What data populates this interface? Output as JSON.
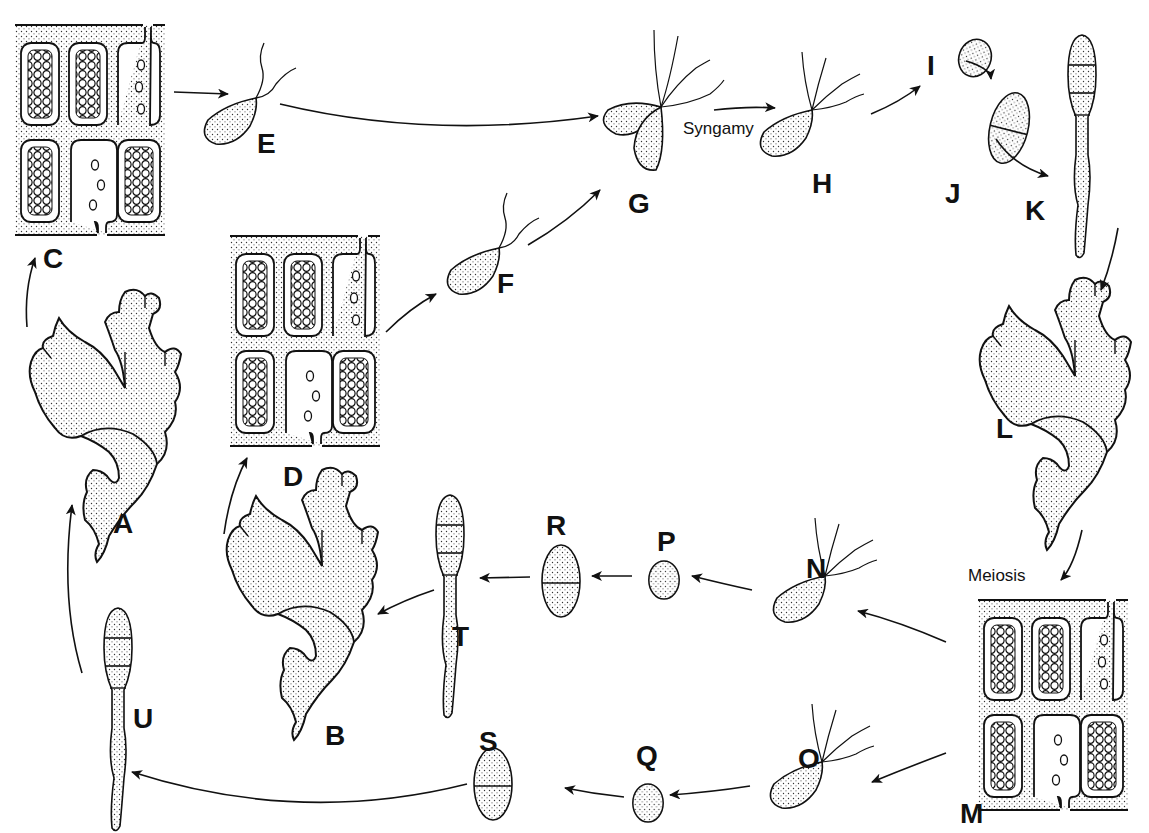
{
  "diagram": {
    "colors": {
      "ink": "#111111",
      "stipple": "#d9d9d9",
      "paper": "#ffffff"
    },
    "annotations": {
      "syngamy": "Syngamy",
      "meiosis": "Meiosis"
    },
    "stages": [
      {
        "id": "A",
        "label": "A",
        "kind": "thallus",
        "x": 113,
        "y": 510
      },
      {
        "id": "B",
        "label": "B",
        "kind": "thallus",
        "x": 325,
        "y": 722
      },
      {
        "id": "C",
        "label": "C",
        "kind": "gametangia-tissue",
        "x": 43,
        "y": 245
      },
      {
        "id": "D",
        "label": "D",
        "kind": "gametangia-tissue",
        "x": 283,
        "y": 463
      },
      {
        "id": "E",
        "label": "E",
        "kind": "biflagellate-gamete",
        "x": 257,
        "y": 130
      },
      {
        "id": "F",
        "label": "F",
        "kind": "biflagellate-gamete",
        "x": 497,
        "y": 270
      },
      {
        "id": "G",
        "label": "G",
        "kind": "fusing-gametes",
        "x": 628,
        "y": 190
      },
      {
        "id": "H",
        "label": "H",
        "kind": "quadriflagellate-zygote",
        "x": 812,
        "y": 170
      },
      {
        "id": "I",
        "label": "I",
        "kind": "zygote",
        "x": 927,
        "y": 52
      },
      {
        "id": "J",
        "label": "J",
        "kind": "two-celled-sporophyte",
        "x": 945,
        "y": 180
      },
      {
        "id": "K",
        "label": "K",
        "kind": "young-sporophyte",
        "x": 1025,
        "y": 197
      },
      {
        "id": "L",
        "label": "L",
        "kind": "thallus",
        "x": 996,
        "y": 415
      },
      {
        "id": "M",
        "label": "M",
        "kind": "sporangia-tissue",
        "x": 960,
        "y": 800
      },
      {
        "id": "N",
        "label": "N",
        "kind": "quadriflagellate-zoospore",
        "x": 806,
        "y": 555
      },
      {
        "id": "O",
        "label": "O",
        "kind": "quadriflagellate-zoospore",
        "x": 798,
        "y": 745
      },
      {
        "id": "P",
        "label": "P",
        "kind": "spore",
        "x": 657,
        "y": 528
      },
      {
        "id": "Q",
        "label": "Q",
        "kind": "spore",
        "x": 636,
        "y": 742
      },
      {
        "id": "R",
        "label": "R",
        "kind": "two-celled-germling",
        "x": 546,
        "y": 512
      },
      {
        "id": "S",
        "label": "S",
        "kind": "two-celled-germling",
        "x": 479,
        "y": 728
      },
      {
        "id": "T",
        "label": "T",
        "kind": "young-gametophyte",
        "x": 452,
        "y": 623
      },
      {
        "id": "U",
        "label": "U",
        "kind": "young-gametophyte",
        "x": 133,
        "y": 705
      }
    ]
  }
}
